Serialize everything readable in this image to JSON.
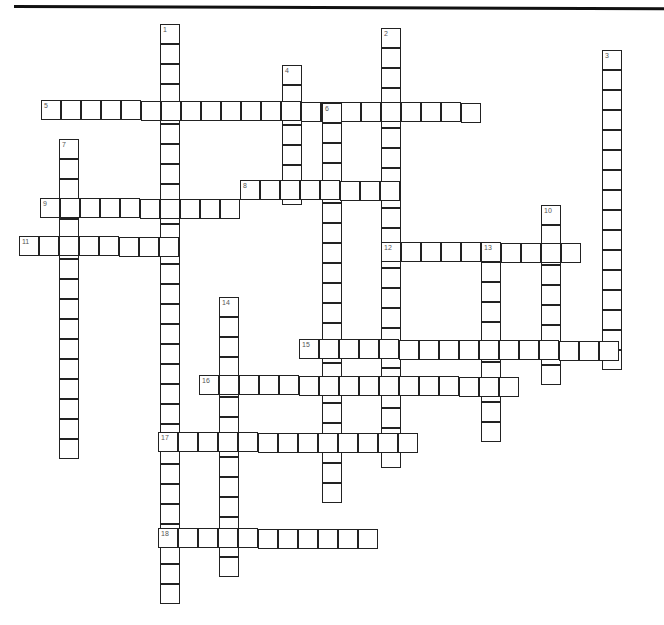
{
  "puzzle": {
    "type": "crossword",
    "cell_size": 20,
    "words": [
      {
        "number": "1",
        "direction": "down",
        "x": 160,
        "y": 24,
        "length": 29
      },
      {
        "number": "2",
        "direction": "down",
        "x": 381,
        "y": 28,
        "length": 22
      },
      {
        "number": "3",
        "direction": "down",
        "x": 602,
        "y": 50,
        "length": 16
      },
      {
        "number": "4",
        "direction": "down",
        "x": 282,
        "y": 65,
        "length": 7
      },
      {
        "number": "5",
        "direction": "across",
        "x": 41,
        "y": 100,
        "length": 22
      },
      {
        "number": "6",
        "direction": "down",
        "x": 322,
        "y": 103,
        "length": 20
      },
      {
        "number": "7",
        "direction": "down",
        "x": 59,
        "y": 139,
        "length": 16
      },
      {
        "number": "8",
        "direction": "across",
        "x": 240,
        "y": 180,
        "length": 8
      },
      {
        "number": "9",
        "direction": "across",
        "x": 40,
        "y": 198,
        "length": 10
      },
      {
        "number": "10",
        "direction": "down",
        "x": 541,
        "y": 205,
        "length": 9
      },
      {
        "number": "11",
        "direction": "across",
        "x": 19,
        "y": 236,
        "length": 8
      },
      {
        "number": "12",
        "direction": "across",
        "x": 381,
        "y": 242,
        "length": 10
      },
      {
        "number": "13",
        "direction": "down",
        "x": 481,
        "y": 242,
        "length": 10
      },
      {
        "number": "14",
        "direction": "down",
        "x": 219,
        "y": 297,
        "length": 14
      },
      {
        "number": "15",
        "direction": "across",
        "x": 299,
        "y": 339,
        "length": 16
      },
      {
        "number": "16",
        "direction": "across",
        "x": 199,
        "y": 375,
        "length": 16
      },
      {
        "number": "17",
        "direction": "across",
        "x": 158,
        "y": 432,
        "length": 13
      },
      {
        "number": "18",
        "direction": "across",
        "x": 158,
        "y": 528,
        "length": 11
      }
    ]
  }
}
